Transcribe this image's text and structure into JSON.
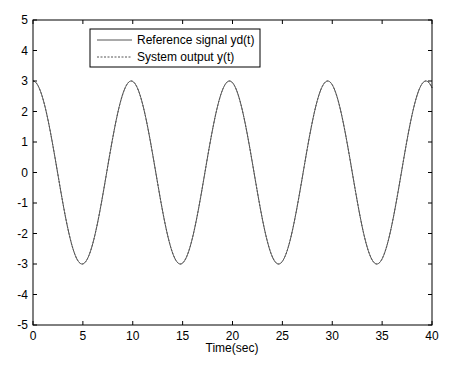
{
  "chart_data": {
    "type": "line",
    "title": "",
    "xlabel": "Time(sec)",
    "ylabel": "",
    "xlim": [
      0,
      40
    ],
    "ylim": [
      -5,
      5
    ],
    "xticks": [
      0,
      5,
      10,
      15,
      20,
      25,
      30,
      35,
      40
    ],
    "yticks": [
      -5,
      -4,
      -3,
      -2,
      -1,
      0,
      1,
      2,
      3,
      4,
      5
    ],
    "grid": false,
    "legend_position": "upper-left-inside",
    "series": [
      {
        "name": "Reference signal yd(t)",
        "style": "solid",
        "color": "#555555",
        "description": "3*cos(0.638*t), t from 0 to 40, peaks at ~0, 9.85, 19.7, 29.5, 39.4; troughs -3 at ~4.9, 14.8, 24.6, 34.5",
        "amplitude": 3,
        "omega": 0.638
      },
      {
        "name": "System output y(t)",
        "style": "dashed",
        "color": "#555555",
        "description": "tracks reference signal, visually overlapping",
        "amplitude": 3,
        "omega": 0.638
      }
    ],
    "sample_points": {
      "x": [
        0,
        2.46,
        4.92,
        7.39,
        9.85,
        14.78,
        19.7,
        24.63,
        29.55,
        34.48,
        39.4,
        40
      ],
      "y": [
        3,
        0,
        -3,
        0,
        3,
        -3,
        3,
        -3,
        3,
        -3,
        3,
        2.8
      ]
    }
  }
}
